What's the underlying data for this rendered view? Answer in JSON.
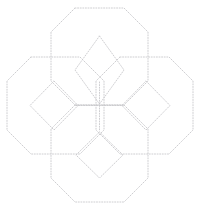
{
  "canvas": {
    "width": 199,
    "height": 211,
    "background": "#ffffff",
    "title": "Dotted geometric quatrefoil construction"
  },
  "style": {
    "stroke_color": "#c8c8cc",
    "stroke_width": 0.9,
    "dash_pattern": "1 1.6",
    "fill": "none",
    "linecap": "round"
  },
  "geometry": {
    "center": {
      "x": 99.5,
      "y": 105.5
    },
    "octagon_half_span": 49,
    "octagon_corner_cut": 24,
    "octagon_offset": 44,
    "diamond_half": 24,
    "diamond_offset": 45
  },
  "shapes": {
    "octagons": [
      {
        "name": "octagon-top",
        "center": {
          "x": 99.5,
          "y": 57
        },
        "points": "75,8 124,8 148,32 148,81 124,105 75,105 51,81 51,32"
      },
      {
        "name": "octagon-left",
        "center": {
          "x": 55,
          "y": 105.5
        },
        "points": "31,57 80,57 104,81 104,130 80,154 31,154 7,130 7,81"
      },
      {
        "name": "octagon-right",
        "center": {
          "x": 144,
          "y": 105.5
        },
        "points": "120,57 169,57 193,81 193,130 169,154 120,154 96,130 96,81"
      },
      {
        "name": "octagon-bottom",
        "center": {
          "x": 99.5,
          "y": 154
        },
        "points": "75,105 124,105 148,129 148,178 124,202 75,202 51,178 51,129"
      }
    ],
    "diamonds": [
      {
        "name": "diamond-top",
        "center": {
          "x": 99.5,
          "y": 70
        },
        "points": "99.5,36 124,70 99.5,104 75,70"
      },
      {
        "name": "diamond-left",
        "center": {
          "x": 54,
          "y": 105.5
        },
        "points": "54,81 78,105.5 54,130 30,105.5"
      },
      {
        "name": "diamond-right",
        "center": {
          "x": 146,
          "y": 105.5
        },
        "points": "146,81 170,105.5 146,130 122,105.5"
      },
      {
        "name": "diamond-bottom",
        "center": {
          "x": 99.5,
          "y": 155
        },
        "points": "99.5,132 123,155 99.5,178 76,155"
      }
    ],
    "cross_lines": [
      {
        "name": "cross-line-horizontal",
        "x1": 76,
        "y1": 105.5,
        "x2": 123,
        "y2": 105.5
      },
      {
        "name": "cross-line-vertical",
        "x1": 99.5,
        "y1": 82,
        "x2": 99.5,
        "y2": 130
      }
    ]
  }
}
